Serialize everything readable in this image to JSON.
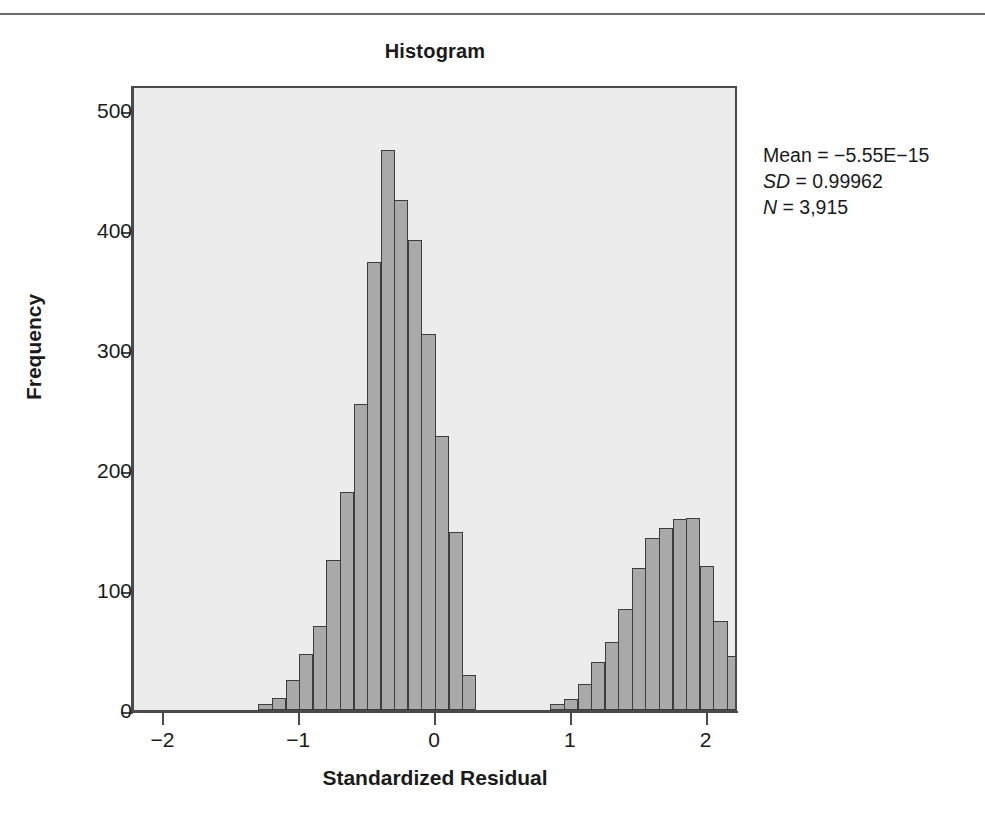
{
  "figure": {
    "title": "Histogram",
    "xlabel": "Standardized Residual",
    "ylabel": "Frequency"
  },
  "stats": {
    "mean_label": "Mean = −5.55E−15",
    "sd_symbol": "SD",
    "sd_value": " = 0.99962",
    "n_symbol": "N",
    "n_value": " = 3,915"
  },
  "axes": {
    "y_ticks": [
      "0",
      "100",
      "200",
      "300",
      "400",
      "500"
    ],
    "x_ticks": [
      "−2",
      "−1",
      "0",
      "1",
      "2"
    ]
  },
  "colors": {
    "bar_fill": "#a9a9a9",
    "bar_stroke": "#3d3d3d",
    "panel_bg": "#ececec",
    "axis": "#4a4a4a",
    "text": "#1a1a1a"
  },
  "chart_data": {
    "type": "bar",
    "title": "Histogram",
    "xlabel": "Standardized Residual",
    "ylabel": "Frequency",
    "xlim": [
      -2.2,
      2.2
    ],
    "ylim": [
      0,
      520
    ],
    "grid": false,
    "legend": null,
    "bin_width": 0.1,
    "annotations": [
      "Mean = −5.55E−15",
      "SD = 0.99962",
      "N = 3,915"
    ],
    "bins": [
      {
        "x": -1.3,
        "value": 5
      },
      {
        "x": -1.2,
        "value": 10
      },
      {
        "x": -1.1,
        "value": 25
      },
      {
        "x": -1.0,
        "value": 47
      },
      {
        "x": -0.9,
        "value": 70
      },
      {
        "x": -0.8,
        "value": 125
      },
      {
        "x": -0.7,
        "value": 182
      },
      {
        "x": -0.6,
        "value": 255
      },
      {
        "x": -0.5,
        "value": 373
      },
      {
        "x": -0.4,
        "value": 467
      },
      {
        "x": -0.3,
        "value": 425
      },
      {
        "x": -0.2,
        "value": 392
      },
      {
        "x": -0.1,
        "value": 313
      },
      {
        "x": 0.0,
        "value": 228
      },
      {
        "x": 0.1,
        "value": 148
      },
      {
        "x": 0.2,
        "value": 29
      },
      {
        "x": 0.85,
        "value": 5
      },
      {
        "x": 0.95,
        "value": 9
      },
      {
        "x": 1.05,
        "value": 22
      },
      {
        "x": 1.15,
        "value": 40
      },
      {
        "x": 1.25,
        "value": 57
      },
      {
        "x": 1.35,
        "value": 84
      },
      {
        "x": 1.45,
        "value": 118
      },
      {
        "x": 1.55,
        "value": 143
      },
      {
        "x": 1.65,
        "value": 152
      },
      {
        "x": 1.75,
        "value": 159
      },
      {
        "x": 1.85,
        "value": 160
      },
      {
        "x": 1.95,
        "value": 120
      },
      {
        "x": 2.05,
        "value": 74
      },
      {
        "x": 2.15,
        "value": 45
      },
      {
        "x": 2.25,
        "value": 17
      },
      {
        "x": 2.35,
        "value": 9
      }
    ],
    "bar_left_px": [
      262,
      275,
      288,
      301,
      314,
      327,
      340,
      353,
      366,
      379,
      392,
      405,
      418,
      431,
      444,
      457,
      559,
      572,
      585,
      598,
      611,
      624,
      637,
      650,
      663,
      676,
      689,
      702,
      560,
      573,
      586,
      599
    ],
    "note": "Bimodal distribution: left mode near -0.65, right mode near 1.6"
  }
}
